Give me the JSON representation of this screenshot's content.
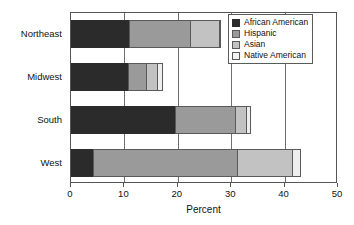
{
  "chart_data": {
    "type": "bar",
    "orientation": "horizontal",
    "stacked": true,
    "title": "",
    "xlabel": "Percent",
    "ylabel": "",
    "xlim": [
      0,
      50
    ],
    "xticks": [
      0,
      10,
      20,
      30,
      40,
      50
    ],
    "xtick_labels": [
      "0",
      "10",
      "20",
      "30",
      "40",
      "50"
    ],
    "grid": "vertical",
    "legend_position": "top-right",
    "categories": [
      "Northeast",
      "Midwest",
      "South",
      "West"
    ],
    "series": [
      {
        "name": "African American",
        "color": "#2b2b2b",
        "values": [
          11.1,
          10.8,
          19.7,
          4.4
        ]
      },
      {
        "name": "Hispanic",
        "color": "#9a9a9a",
        "values": [
          11.6,
          3.7,
          11.4,
          27.1
        ]
      },
      {
        "name": "Asian",
        "color": "#c2c2c2",
        "values": [
          5.6,
          2.2,
          2.2,
          10.4
        ]
      },
      {
        "name": "Native American",
        "color": "#eeeeee",
        "values": [
          0.3,
          1.1,
          1.0,
          1.7
        ]
      }
    ],
    "totals": [
      28.6,
      17.8,
      34.3,
      43.6
    ]
  },
  "axes": {
    "x_title": "Percent",
    "x_tick_labels": [
      "0",
      "10",
      "20",
      "30",
      "40",
      "50"
    ],
    "y_tick_labels": [
      "Northeast",
      "Midwest",
      "South",
      "West"
    ]
  },
  "legend": {
    "items": [
      {
        "label": "African American"
      },
      {
        "label": "Hispanic"
      },
      {
        "label": "Asian"
      },
      {
        "label": "Native American"
      }
    ]
  }
}
